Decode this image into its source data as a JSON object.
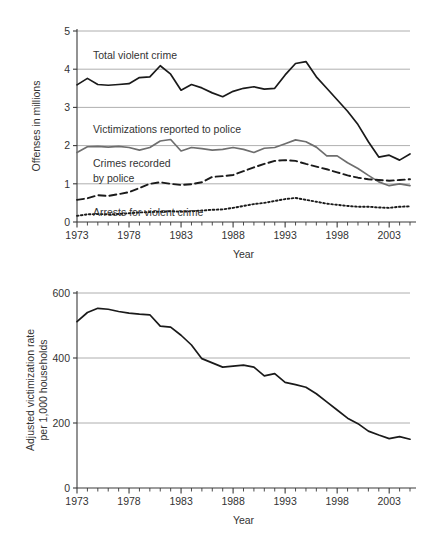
{
  "figures": [
    {
      "id": "violent-crime-trends",
      "axis": {
        "ylabel": "Offenses in millions",
        "xlabel": "Year",
        "yticks": [
          "0",
          "1",
          "2",
          "3",
          "4",
          "5"
        ],
        "xticks": [
          "1973",
          "1978",
          "1983",
          "1988",
          "1993",
          "1998",
          "2003"
        ]
      },
      "annotations": [
        {
          "name": "total-violent-crime",
          "text": "Total violent crime"
        },
        {
          "name": "victimizations-reported",
          "text": "Victimizations reported to police"
        },
        {
          "name": "crimes-recorded-line1",
          "text": "Crimes recorded"
        },
        {
          "name": "crimes-recorded-line2",
          "text": "by police"
        },
        {
          "name": "arrests-violent-crime",
          "text": "Arrests for violent crime"
        }
      ]
    },
    {
      "id": "adjusted-victimization-rate",
      "axis": {
        "ylabel_line1": "Adjusted victimization rate",
        "ylabel_line2": "per 1,000 households",
        "xlabel": "Year",
        "yticks": [
          "0",
          "200",
          "400",
          "600"
        ],
        "xticks": [
          "1973",
          "1978",
          "1983",
          "1988",
          "1993",
          "1998",
          "2003"
        ]
      }
    }
  ],
  "colors": {
    "total_violent_crime": "#1a1a1a",
    "victimizations_reported": "#6e6e6e",
    "crimes_recorded": "#1a1a1a",
    "arrests": "#1a1a1a",
    "victimization_rate": "#1a1a1a",
    "gridline": "#9a9a9a",
    "axis": "#3a3a3a",
    "text": "#333333",
    "background": "#ffffff"
  },
  "chart_data": [
    {
      "type": "line",
      "title": "",
      "xlabel": "Year",
      "ylabel": "Offenses in millions",
      "xlim": [
        1973,
        2005
      ],
      "ylim": [
        0,
        5
      ],
      "grid": "horizontal",
      "legend": "inline-annotations",
      "x": [
        1973,
        1974,
        1975,
        1976,
        1977,
        1978,
        1979,
        1980,
        1981,
        1982,
        1983,
        1984,
        1985,
        1986,
        1987,
        1988,
        1989,
        1990,
        1991,
        1992,
        1993,
        1994,
        1995,
        1996,
        1997,
        1998,
        1999,
        2000,
        2001,
        2002,
        2003,
        2004,
        2005
      ],
      "series": [
        {
          "name": "Total violent crime",
          "style": "solid",
          "color": "#1a1a1a",
          "values": [
            3.59,
            3.76,
            3.6,
            3.58,
            3.6,
            3.62,
            3.78,
            3.8,
            4.09,
            3.87,
            3.45,
            3.6,
            3.51,
            3.38,
            3.28,
            3.42,
            3.5,
            3.54,
            3.48,
            3.5,
            3.85,
            4.15,
            4.2,
            3.8,
            3.5,
            3.2,
            2.9,
            2.55,
            2.1,
            1.7,
            1.75,
            1.62,
            1.78
          ]
        },
        {
          "name": "Victimizations reported to police",
          "style": "solid",
          "color": "#6e6e6e",
          "values": [
            1.82,
            1.97,
            1.98,
            1.96,
            1.98,
            1.95,
            1.88,
            1.95,
            2.12,
            2.16,
            1.86,
            1.95,
            1.92,
            1.88,
            1.9,
            1.95,
            1.9,
            1.82,
            1.93,
            1.95,
            2.05,
            2.15,
            2.1,
            1.96,
            1.73,
            1.73,
            1.55,
            1.4,
            1.22,
            1.05,
            0.95,
            1.0,
            0.95
          ]
        },
        {
          "name": "Crimes recorded by police",
          "style": "dashed",
          "color": "#1a1a1a",
          "values": [
            0.58,
            0.62,
            0.7,
            0.68,
            0.73,
            0.78,
            0.89,
            1.0,
            1.04,
            1.0,
            0.97,
            0.99,
            1.04,
            1.18,
            1.2,
            1.23,
            1.33,
            1.43,
            1.52,
            1.6,
            1.62,
            1.6,
            1.52,
            1.45,
            1.38,
            1.3,
            1.22,
            1.16,
            1.12,
            1.1,
            1.08,
            1.1,
            1.12
          ]
        },
        {
          "name": "Arrests for violent crime",
          "style": "dotted",
          "color": "#1a1a1a",
          "values": [
            0.16,
            0.2,
            0.21,
            0.2,
            0.21,
            0.23,
            0.25,
            0.26,
            0.27,
            0.28,
            0.27,
            0.28,
            0.3,
            0.32,
            0.33,
            0.37,
            0.42,
            0.47,
            0.5,
            0.55,
            0.6,
            0.63,
            0.58,
            0.53,
            0.48,
            0.45,
            0.42,
            0.4,
            0.4,
            0.38,
            0.37,
            0.4,
            0.41
          ]
        }
      ]
    },
    {
      "type": "line",
      "title": "",
      "xlabel": "Year",
      "ylabel": "Adjusted victimization rate per 1,000 households",
      "xlim": [
        1973,
        2005
      ],
      "ylim": [
        0,
        600
      ],
      "grid": "horizontal",
      "legend": "none",
      "x": [
        1973,
        1974,
        1975,
        1976,
        1977,
        1978,
        1979,
        1980,
        1981,
        1982,
        1983,
        1984,
        1985,
        1986,
        1987,
        1988,
        1989,
        1990,
        1991,
        1992,
        1993,
        1994,
        1995,
        1996,
        1997,
        1998,
        1999,
        2000,
        2001,
        2002,
        2003,
        2004,
        2005
      ],
      "series": [
        {
          "name": "Adjusted victimization rate per 1,000 households",
          "style": "solid",
          "color": "#1a1a1a",
          "values": [
            512,
            540,
            553,
            550,
            543,
            538,
            535,
            533,
            498,
            495,
            470,
            440,
            398,
            385,
            372,
            375,
            378,
            372,
            345,
            352,
            325,
            318,
            310,
            290,
            265,
            240,
            215,
            198,
            175,
            163,
            152,
            158,
            150
          ]
        }
      ]
    }
  ]
}
